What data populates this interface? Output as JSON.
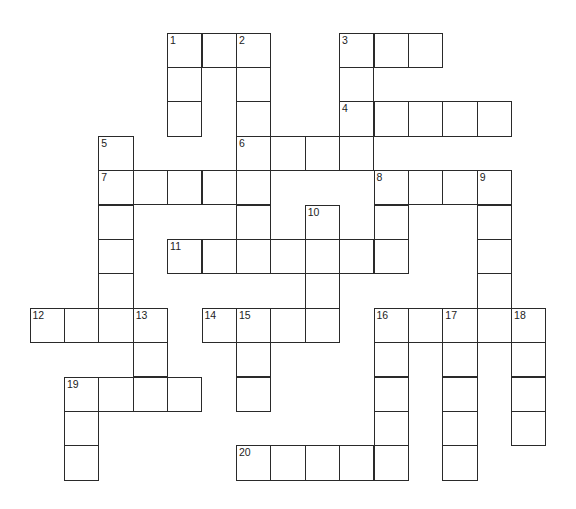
{
  "puzzle": {
    "type": "crossword",
    "origin_x": 30,
    "origin_y": 33,
    "cell_size": 34.4,
    "cols": 15,
    "rows": 13,
    "line_color": "#2a2a2a",
    "cells": [
      [
        0,
        4,
        "1"
      ],
      [
        0,
        5,
        ""
      ],
      [
        0,
        6,
        "2"
      ],
      [
        0,
        9,
        "3"
      ],
      [
        0,
        10,
        ""
      ],
      [
        0,
        11,
        ""
      ],
      [
        1,
        4,
        ""
      ],
      [
        1,
        6,
        ""
      ],
      [
        1,
        9,
        ""
      ],
      [
        2,
        4,
        ""
      ],
      [
        2,
        6,
        ""
      ],
      [
        2,
        9,
        "4"
      ],
      [
        2,
        10,
        ""
      ],
      [
        2,
        11,
        ""
      ],
      [
        2,
        12,
        ""
      ],
      [
        2,
        13,
        ""
      ],
      [
        3,
        2,
        "5"
      ],
      [
        3,
        6,
        "6"
      ],
      [
        3,
        7,
        ""
      ],
      [
        3,
        8,
        ""
      ],
      [
        3,
        9,
        ""
      ],
      [
        4,
        2,
        "7"
      ],
      [
        4,
        3,
        ""
      ],
      [
        4,
        4,
        ""
      ],
      [
        4,
        5,
        ""
      ],
      [
        4,
        6,
        ""
      ],
      [
        4,
        10,
        "8"
      ],
      [
        4,
        11,
        ""
      ],
      [
        4,
        12,
        ""
      ],
      [
        4,
        13,
        "9"
      ],
      [
        5,
        2,
        ""
      ],
      [
        5,
        6,
        ""
      ],
      [
        5,
        8,
        "10"
      ],
      [
        5,
        10,
        ""
      ],
      [
        5,
        13,
        ""
      ],
      [
        6,
        2,
        ""
      ],
      [
        6,
        4,
        "11"
      ],
      [
        6,
        5,
        ""
      ],
      [
        6,
        6,
        ""
      ],
      [
        6,
        7,
        ""
      ],
      [
        6,
        8,
        ""
      ],
      [
        6,
        9,
        ""
      ],
      [
        6,
        10,
        ""
      ],
      [
        6,
        13,
        ""
      ],
      [
        7,
        2,
        ""
      ],
      [
        7,
        8,
        ""
      ],
      [
        7,
        13,
        ""
      ],
      [
        8,
        0,
        "12"
      ],
      [
        8,
        1,
        ""
      ],
      [
        8,
        2,
        ""
      ],
      [
        8,
        3,
        "13"
      ],
      [
        8,
        5,
        "14"
      ],
      [
        8,
        6,
        "15"
      ],
      [
        8,
        7,
        ""
      ],
      [
        8,
        8,
        ""
      ],
      [
        8,
        10,
        "16"
      ],
      [
        8,
        11,
        ""
      ],
      [
        8,
        12,
        "17"
      ],
      [
        8,
        13,
        ""
      ],
      [
        8,
        14,
        "18"
      ],
      [
        9,
        3,
        ""
      ],
      [
        9,
        6,
        ""
      ],
      [
        9,
        10,
        ""
      ],
      [
        9,
        12,
        ""
      ],
      [
        9,
        14,
        ""
      ],
      [
        10,
        1,
        "19"
      ],
      [
        10,
        2,
        ""
      ],
      [
        10,
        3,
        ""
      ],
      [
        10,
        4,
        ""
      ],
      [
        10,
        6,
        ""
      ],
      [
        10,
        10,
        ""
      ],
      [
        10,
        12,
        ""
      ],
      [
        10,
        14,
        ""
      ],
      [
        11,
        1,
        ""
      ],
      [
        11,
        10,
        ""
      ],
      [
        11,
        12,
        ""
      ],
      [
        11,
        14,
        ""
      ],
      [
        12,
        1,
        ""
      ],
      [
        12,
        6,
        "20"
      ],
      [
        12,
        7,
        ""
      ],
      [
        12,
        8,
        ""
      ],
      [
        12,
        9,
        ""
      ],
      [
        12,
        10,
        ""
      ],
      [
        12,
        12,
        ""
      ]
    ],
    "across": [
      {
        "number": "1",
        "row": 0,
        "col": 4,
        "length": 3
      },
      {
        "number": "3",
        "row": 0,
        "col": 9,
        "length": 3
      },
      {
        "number": "4",
        "row": 2,
        "col": 9,
        "length": 5
      },
      {
        "number": "6",
        "row": 3,
        "col": 6,
        "length": 4
      },
      {
        "number": "7",
        "row": 4,
        "col": 2,
        "length": 5
      },
      {
        "number": "8",
        "row": 4,
        "col": 10,
        "length": 4
      },
      {
        "number": "11",
        "row": 6,
        "col": 4,
        "length": 7
      },
      {
        "number": "12",
        "row": 8,
        "col": 0,
        "length": 4
      },
      {
        "number": "14",
        "row": 8,
        "col": 5,
        "length": 4
      },
      {
        "number": "16",
        "row": 8,
        "col": 10,
        "length": 5
      },
      {
        "number": "19",
        "row": 10,
        "col": 1,
        "length": 4
      },
      {
        "number": "20",
        "row": 12,
        "col": 6,
        "length": 5
      }
    ],
    "down": [
      {
        "number": "1",
        "row": 0,
        "col": 4,
        "length": 3
      },
      {
        "number": "2",
        "row": 0,
        "col": 6,
        "length": 7
      },
      {
        "number": "3",
        "row": 0,
        "col": 9,
        "length": 4
      },
      {
        "number": "5",
        "row": 3,
        "col": 2,
        "length": 6
      },
      {
        "number": "8",
        "row": 4,
        "col": 10,
        "length": 3
      },
      {
        "number": "9",
        "row": 4,
        "col": 13,
        "length": 5
      },
      {
        "number": "10",
        "row": 5,
        "col": 8,
        "length": 4
      },
      {
        "number": "13",
        "row": 8,
        "col": 3,
        "length": 3
      },
      {
        "number": "15",
        "row": 8,
        "col": 6,
        "length": 3
      },
      {
        "number": "16",
        "row": 8,
        "col": 10,
        "length": 5
      },
      {
        "number": "17",
        "row": 8,
        "col": 12,
        "length": 5
      },
      {
        "number": "18",
        "row": 8,
        "col": 14,
        "length": 4
      },
      {
        "number": "19",
        "row": 10,
        "col": 1,
        "length": 3
      }
    ]
  }
}
